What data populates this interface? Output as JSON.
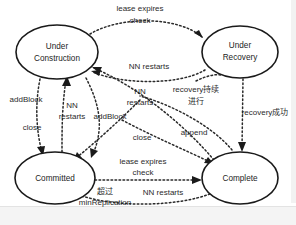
{
  "diagram": {
    "background_color": "#ffffff",
    "stroke_color": "#1a1a1a",
    "edge_style": "dotted",
    "nodes": [
      {
        "id": "under-construction",
        "line1": "Under",
        "line2": "Construction",
        "cx": 57,
        "cy": 52,
        "rx": 41,
        "ry": 27
      },
      {
        "id": "under-recovery",
        "line1": "Under",
        "line2": "Recovery",
        "cx": 240,
        "cy": 52,
        "rx": 38,
        "ry": 26
      },
      {
        "id": "committed",
        "line1": "Committed",
        "line2": "",
        "cx": 55,
        "cy": 178,
        "rx": 40,
        "ry": 26
      },
      {
        "id": "complete",
        "line1": "Complete",
        "line2": "",
        "cx": 240,
        "cy": 178,
        "rx": 38,
        "ry": 26
      }
    ],
    "edge_labels": [
      {
        "id": "lease-expires-check-top",
        "line1": "lease expires",
        "line2": "check",
        "x": 140,
        "y": 9
      },
      {
        "id": "nn-restarts-mid",
        "line1": "NN restarts",
        "line2": "",
        "x": 149,
        "y": 67
      },
      {
        "id": "nn-restarts-lower-mid",
        "line1": "NN",
        "line2": "restarts",
        "x": 140,
        "y": 92
      },
      {
        "id": "recovery-continues",
        "line1": "recovery持续",
        "line2": "进行",
        "x": 196,
        "y": 90
      },
      {
        "id": "recovery-success",
        "line1": "recovery成功",
        "line2": "",
        "x": 265,
        "y": 113
      },
      {
        "id": "add-block-left",
        "line1": "addBlock",
        "line2": "",
        "x": 26,
        "y": 100
      },
      {
        "id": "close-left",
        "line1": "close",
        "line2": "",
        "x": 32,
        "y": 128
      },
      {
        "id": "nn-restarts-left",
        "line1": "NN",
        "line2": "restarts",
        "x": 72,
        "y": 106
      },
      {
        "id": "add-block-center",
        "line1": "addBlock",
        "line2": "",
        "x": 110,
        "y": 117
      },
      {
        "id": "close-center",
        "line1": "close",
        "line2": "",
        "x": 142,
        "y": 138
      },
      {
        "id": "append",
        "line1": "append",
        "line2": "",
        "x": 194,
        "y": 133
      },
      {
        "id": "lease-expires-check-bottom",
        "line1": "lease expires",
        "line2": "check",
        "x": 143,
        "y": 162
      },
      {
        "id": "exceeds-min-replication",
        "line1": "超过",
        "line2": "minReplication",
        "x": 105,
        "y": 192
      },
      {
        "id": "nn-restarts-bottom",
        "line1": "NN restarts",
        "line2": "",
        "x": 163,
        "y": 193
      }
    ]
  }
}
